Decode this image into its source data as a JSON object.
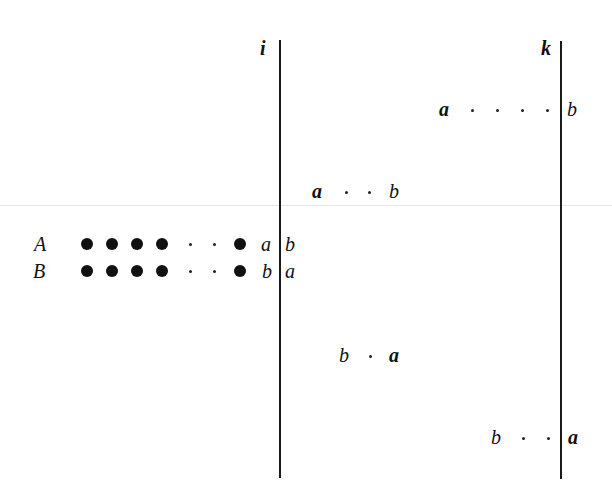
{
  "diagram": {
    "columns": [
      {
        "id": "i",
        "label": "i"
      },
      {
        "id": "k",
        "label": "k"
      }
    ],
    "rows": [
      {
        "label": "A",
        "last_symbol": "a",
        "right_symbol": "b"
      },
      {
        "label": "B",
        "last_symbol": "b",
        "right_symbol": "a"
      }
    ],
    "segments": [
      {
        "left": "a",
        "right": "b",
        "position": "before column k, upper"
      },
      {
        "left": "a",
        "right": "b",
        "position": "after column i, upper"
      },
      {
        "left": "b",
        "right": "a",
        "position": "after column i, lower"
      },
      {
        "left": "b",
        "right": "a",
        "position": "before column k, lower"
      }
    ],
    "symbols": {
      "a": "a",
      "b": "b"
    }
  }
}
